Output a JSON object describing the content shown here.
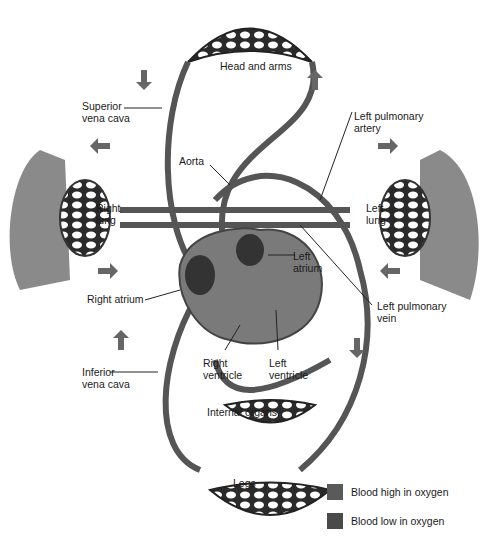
{
  "labels": {
    "head_arms": "Head and arms",
    "superior_vc": [
      "Superior",
      "vena cava"
    ],
    "aorta": "Aorta",
    "left_pulm_artery": [
      "Left pulmonary",
      "artery"
    ],
    "right_lung": [
      "Right",
      "lung"
    ],
    "left_lung": [
      "Left",
      "lung"
    ],
    "left_atrium": [
      "Left",
      "atrium"
    ],
    "right_atrium": "Right atrium",
    "left_pulm_vein": [
      "Left pulmonary",
      "vein"
    ],
    "inferior_vc": [
      "Inferior",
      "vena cava"
    ],
    "right_ventricle": [
      "Right",
      "ventricle"
    ],
    "left_ventricle": [
      "Left",
      "ventricle"
    ],
    "internal_organs": "Internal organs",
    "legs": "Legs"
  },
  "legend": [
    {
      "label": "Blood high in oxygen",
      "color": "#5a5a5a"
    },
    {
      "label": "Blood low in oxygen",
      "color": "#4a4a4a"
    }
  ],
  "colors": {
    "vessel": "#555555",
    "lung": "#8a8a8a",
    "heart": "#7a7a7a",
    "arrow": "#666666"
  }
}
